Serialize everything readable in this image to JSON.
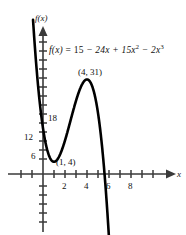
{
  "chart_data": {
    "type": "line",
    "title": "",
    "function_label": "f(x) = 15 - 24x + 15x² - 2x³",
    "equation": {
      "lhs": "f(x)",
      "equals": "=",
      "term_constant": "15",
      "term_linear": "− 24x",
      "term_quadratic": "+ 15x",
      "term_quadratic_exp": "2",
      "term_cubic": "− 2x",
      "term_cubic_exp": "3"
    },
    "coefficients": {
      "a3": -2,
      "a2": 15,
      "a1": -24,
      "a0": 15
    },
    "xlabel": "x",
    "ylabel": "f(x)",
    "xlim": [
      -2.6,
      9.6
    ],
    "ylim": [
      -21,
      45
    ],
    "xticks": [
      -2,
      -1,
      1,
      2,
      3,
      4,
      5,
      6,
      7,
      8,
      9
    ],
    "xtick_labels": [
      "2",
      "4",
      "6",
      "8"
    ],
    "xtick_labeled_values": [
      2,
      4,
      6,
      8
    ],
    "yticks": [
      -18,
      -15,
      -12,
      -9,
      -6,
      -3,
      3,
      6,
      9,
      12,
      15,
      18,
      21,
      24,
      27,
      30,
      33,
      36,
      39,
      42
    ],
    "ytick_labels": [
      "18",
      "12",
      "6"
    ],
    "ytick_labeled_values": [
      18,
      12,
      6
    ],
    "grid": false,
    "legend": false,
    "annotations": [
      {
        "label": "(4, 31)",
        "x": 4,
        "y": 31,
        "kind": "local-maximum"
      },
      {
        "label": "(1, 4)",
        "x": 1,
        "y": 4,
        "kind": "local-minimum"
      }
    ],
    "curve_color": "#000000",
    "axis_color": "#3a3a3a",
    "x_intercept_approx": 5.6,
    "y_intercept": 15
  },
  "labels": {
    "y_axis_name": "f(x)",
    "x_axis_name": "x",
    "tick_18": "18",
    "tick_12": "12",
    "tick_6": "6",
    "tick_2": "2",
    "tick_4": "4",
    "tick_6x": "6",
    "tick_8": "8",
    "max_point": "(4, 31)",
    "min_point": "(1, 4)"
  }
}
